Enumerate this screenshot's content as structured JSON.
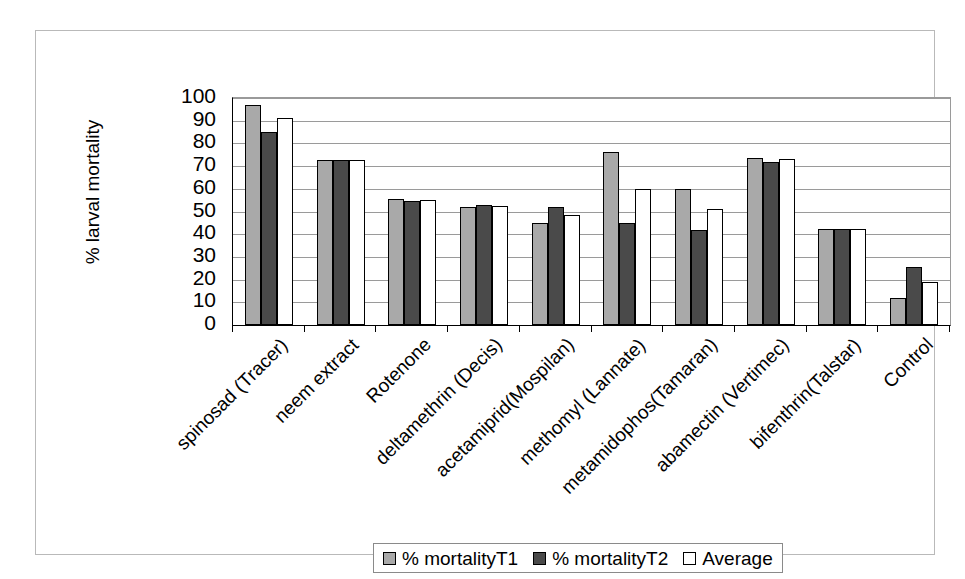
{
  "chart_data": {
    "type": "bar",
    "title": "",
    "xlabel": "",
    "ylabel": "% larval mortality",
    "ylim": [
      0,
      100
    ],
    "ytick_values": [
      0,
      10,
      20,
      30,
      40,
      50,
      60,
      70,
      80,
      90,
      100
    ],
    "ytick_labels": [
      "0",
      "10",
      "20",
      "30",
      "40",
      "50",
      "60",
      "70",
      "80",
      "90",
      "100"
    ],
    "grid": true,
    "legend_position": "bottom",
    "categories": [
      "spinosad (Tracer)",
      "neem extract",
      "Rotenone",
      "deltamethrin (Decis)",
      "acetamiprid(Mospilan)",
      "methomyl (Lannate)",
      "metamidophos(Tamaran)",
      "abamectin (Vertimec)",
      "bifenthrin(Talstar)",
      "Control"
    ],
    "series": [
      {
        "name": "% mortalityT1",
        "color": "#a9a9a9",
        "values": [
          97,
          72.5,
          55.5,
          52,
          45,
          76,
          60,
          73.5,
          42.5,
          12
        ]
      },
      {
        "name": "% mortalityT2",
        "color": "#4a4a4a",
        "values": [
          85,
          72.5,
          54.5,
          53,
          52,
          45,
          42,
          72,
          42.5,
          25.5
        ]
      },
      {
        "name": "Average",
        "color": "#ffffff",
        "values": [
          91,
          72.5,
          55,
          52.5,
          48.5,
          60,
          51,
          73,
          42.5,
          19
        ]
      }
    ]
  },
  "legend": {
    "entries": [
      {
        "label": "% mortalityT1",
        "swatch": "s0"
      },
      {
        "label": "% mortalityT2",
        "swatch": "s1"
      },
      {
        "label": "Average",
        "swatch": "s2"
      }
    ]
  }
}
